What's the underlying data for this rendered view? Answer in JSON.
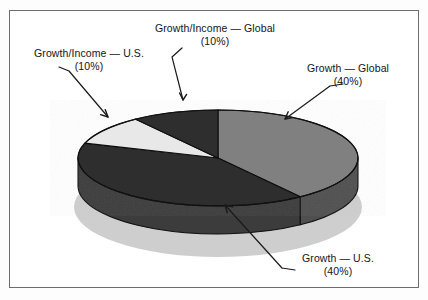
{
  "figure": {
    "background": "#ffffff",
    "frame_color": "#6d6d6d"
  },
  "chart_data": {
    "type": "pie",
    "title": "",
    "style": "3d-exploded-none",
    "start_angle_deg": 0,
    "direction": "clockwise",
    "legend_position": "none",
    "labels_position": "outside-with-leader-lines",
    "categories": [
      "Growth — Global",
      "Growth — U.S.",
      "Growth/Income — U.S.",
      "Growth/Income — Global"
    ],
    "values": [
      40,
      40,
      10,
      10
    ],
    "value_labels": [
      "(40%)",
      "(40%)",
      "(10%)",
      "(10%)"
    ],
    "units": "percent",
    "total": 100,
    "colors": [
      "#808080",
      "#2e2e2e",
      "#e8e8e8",
      "#2e2e2e"
    ],
    "slices": [
      {
        "name": "Growth — Global",
        "value": 40,
        "value_label": "(40%)",
        "color": "#808080",
        "side_color": "#4f4f4f",
        "start_deg": 0,
        "end_deg": 144
      },
      {
        "name": "Growth — U.S.",
        "value": 40,
        "value_label": "(40%)",
        "color": "#2e2e2e",
        "side_color": "#3c3c3c",
        "start_deg": 144,
        "end_deg": 288
      },
      {
        "name": "Growth/Income — U.S.",
        "value": 10,
        "value_label": "(10%)",
        "color": "#e8e8e8",
        "side_color": "#b4b4b4",
        "start_deg": 288,
        "end_deg": 324
      },
      {
        "name": "Growth/Income — Global",
        "value": 10,
        "value_label": "(10%)",
        "color": "#2e2e2e",
        "side_color": "#3c3c3c",
        "start_deg": 324,
        "end_deg": 360
      }
    ]
  },
  "labels": {
    "growth_income_global": {
      "text": "Growth/Income — Global",
      "pct": "(10%)"
    },
    "growth_income_us": {
      "text": "Growth/Income — U.S.",
      "pct": "(10%)"
    },
    "growth_global": {
      "text": "Growth — Global",
      "pct": "(40%)"
    },
    "growth_us": {
      "text": "Growth — U.S.",
      "pct": "(40%)"
    }
  }
}
